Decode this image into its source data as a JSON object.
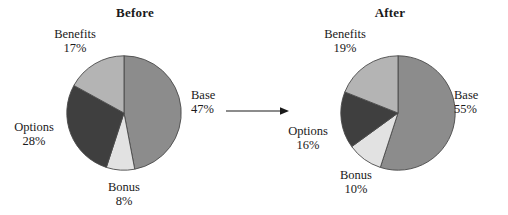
{
  "figure": {
    "background": "#ffffff",
    "connector": {
      "icon": "right-arrow-icon",
      "color": "#1a1a1a"
    }
  },
  "palette": {
    "base": "#8c8c8c",
    "bonus": "#e2e2e2",
    "options": "#3f3f3f",
    "benefits": "#b4b4b4",
    "outline": "#4a4a4a",
    "text": "#1a1a1a"
  },
  "chart_data": [
    {
      "type": "pie",
      "title": "Before",
      "xlabel": "",
      "ylabel": "",
      "start_angle_deg": 90,
      "direction": "clockwise",
      "legend": "none",
      "grid": false,
      "categories": [
        "Base",
        "Bonus",
        "Options",
        "Benefits"
      ],
      "values": [
        47,
        8,
        28,
        17
      ],
      "labels": [
        "47%",
        "8%",
        "28%",
        "17%"
      ],
      "colors": [
        "#8c8c8c",
        "#e2e2e2",
        "#3f3f3f",
        "#b4b4b4"
      ],
      "slices": [
        {
          "name": "Base",
          "value": 47,
          "label": "47%",
          "color": "#8c8c8c"
        },
        {
          "name": "Bonus",
          "value": 8,
          "label": "8%",
          "color": "#e2e2e2"
        },
        {
          "name": "Options",
          "value": 28,
          "label": "28%",
          "color": "#3f3f3f"
        },
        {
          "name": "Benefits",
          "value": 17,
          "label": "17%",
          "color": "#b4b4b4"
        }
      ]
    },
    {
      "type": "pie",
      "title": "After",
      "xlabel": "",
      "ylabel": "",
      "start_angle_deg": 90,
      "direction": "clockwise",
      "legend": "none",
      "grid": false,
      "categories": [
        "Base",
        "Bonus",
        "Options",
        "Benefits"
      ],
      "values": [
        55,
        10,
        16,
        19
      ],
      "labels": [
        "55%",
        "10%",
        "16%",
        "19%"
      ],
      "colors": [
        "#8c8c8c",
        "#e2e2e2",
        "#3f3f3f",
        "#b4b4b4"
      ],
      "slices": [
        {
          "name": "Base",
          "value": 55,
          "label": "55%",
          "color": "#8c8c8c"
        },
        {
          "name": "Bonus",
          "value": 10,
          "label": "10%",
          "color": "#e2e2e2"
        },
        {
          "name": "Options",
          "value": 16,
          "label": "16%",
          "color": "#3f3f3f"
        },
        {
          "name": "Benefits",
          "value": 19,
          "label": "19%",
          "color": "#b4b4b4"
        }
      ]
    }
  ]
}
